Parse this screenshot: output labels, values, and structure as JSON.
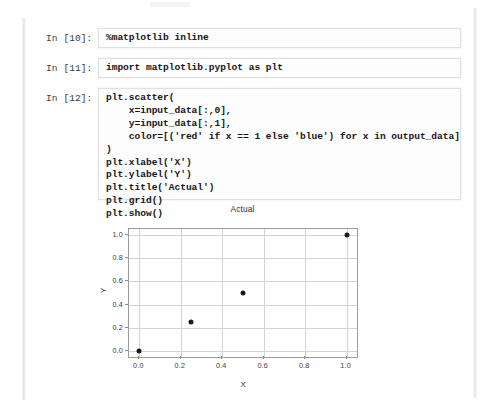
{
  "notebook": {
    "cells": [
      {
        "prompt": "In [10]:",
        "source": "%matplotlib inline"
      },
      {
        "prompt": "In [11]:",
        "source": "import matplotlib.pyplot as plt"
      },
      {
        "prompt": "In [12]:",
        "source": "plt.scatter(\n    x=input_data[:,0],\n    y=input_data[:,1],\n    color=[('red' if x == 1 else 'blue') for x in output_data]\n)\nplt.xlabel('X')\nplt.ylabel('Y')\nplt.title('Actual')\nplt.grid()\nplt.show()"
      }
    ]
  },
  "chart_data": {
    "type": "scatter",
    "title": "Actual",
    "xlabel": "X",
    "ylabel": "Y",
    "x": [
      0.0,
      0.25,
      0.5,
      1.0
    ],
    "y": [
      0.0,
      0.25,
      0.5,
      1.0
    ],
    "xlim": [
      -0.05,
      1.05
    ],
    "ylim": [
      -0.05,
      1.05
    ],
    "xticks": [
      "0.0",
      "0.2",
      "0.4",
      "0.6",
      "0.8",
      "1.0"
    ],
    "xtick_values": [
      0.0,
      0.2,
      0.4,
      0.6,
      0.8,
      1.0
    ],
    "yticks": [
      "0.0",
      "0.2",
      "0.4",
      "0.6",
      "0.8",
      "1.0"
    ],
    "ytick_values": [
      0.0,
      0.2,
      0.4,
      0.6,
      0.8,
      1.0
    ],
    "grid": true,
    "legend": null,
    "marker_color": "#1a1a1a",
    "grid_color": "#d3d3d3"
  }
}
